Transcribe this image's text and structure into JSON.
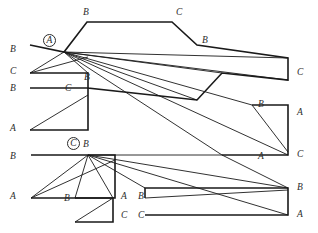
{
  "figure": {
    "canvas": {
      "width": 318,
      "height": 233
    },
    "stroke_color": "#1a1a1a",
    "background_color": "#ffffff",
    "label_color": "#2b2b2b",
    "hub_points": [
      {
        "id": "hub-a",
        "label": "A",
        "x": 64,
        "y": 52,
        "circled": true
      },
      {
        "id": "hub-c",
        "label": "C",
        "x": 88,
        "y": 155,
        "circled": true
      }
    ],
    "vertex_labels": [
      {
        "id": "v-top-b",
        "label": "B",
        "x": 83,
        "y": 8
      },
      {
        "id": "v-top-c",
        "label": "C",
        "x": 176,
        "y": 8
      },
      {
        "id": "v-upper-right-b",
        "label": "B",
        "x": 202,
        "y": 36
      },
      {
        "id": "v-left-b-1",
        "label": "B",
        "x": 10,
        "y": 45
      },
      {
        "id": "v-left-c-1",
        "label": "C",
        "x": 10,
        "y": 67
      },
      {
        "id": "v-right-c-1",
        "label": "C",
        "x": 297,
        "y": 68
      },
      {
        "id": "v-mid-b-1",
        "label": "B",
        "x": 84,
        "y": 73
      },
      {
        "id": "v-left-b-2",
        "label": "B",
        "x": 10,
        "y": 84
      },
      {
        "id": "v-mid-c-1",
        "label": "C",
        "x": 65,
        "y": 84
      },
      {
        "id": "v-right-b-1",
        "label": "B",
        "x": 258,
        "y": 100
      },
      {
        "id": "v-right-a-1",
        "label": "A",
        "x": 297,
        "y": 108
      },
      {
        "id": "v-left-a-1",
        "label": "A",
        "x": 10,
        "y": 124
      },
      {
        "id": "v-hub-c-b",
        "label": "B",
        "x": 83,
        "y": 140
      },
      {
        "id": "v-left-b-3",
        "label": "B",
        "x": 10,
        "y": 152
      },
      {
        "id": "v-mid-a-1",
        "label": "A",
        "x": 258,
        "y": 152
      },
      {
        "id": "v-right-c-2",
        "label": "C",
        "x": 297,
        "y": 150
      },
      {
        "id": "v-left-a-2",
        "label": "A",
        "x": 10,
        "y": 192
      },
      {
        "id": "v-bot-b-1",
        "label": "B",
        "x": 64,
        "y": 194
      },
      {
        "id": "v-bot-a-1",
        "label": "A",
        "x": 121,
        "y": 192
      },
      {
        "id": "v-bot-b-2",
        "label": "B",
        "x": 138,
        "y": 192
      },
      {
        "id": "v-bot-c-1",
        "label": "C",
        "x": 121,
        "y": 211
      },
      {
        "id": "v-bot-c-2",
        "label": "C",
        "x": 138,
        "y": 211
      },
      {
        "id": "v-right-b-2",
        "label": "B",
        "x": 297,
        "y": 183
      },
      {
        "id": "v-right-a-2",
        "label": "A",
        "x": 297,
        "y": 210
      }
    ],
    "outlines": [
      {
        "id": "shape-top",
        "points": "30,45 64,52 87,22 172,22 197,45 288,58 288,80 222,73 197,100 88,88 88,73 30,73"
      },
      {
        "id": "shape-upper-band",
        "points": "30,88 88,88 88,130 30,130"
      },
      {
        "id": "shape-right-upper",
        "points": "252,105 288,105 288,155 222,155"
      },
      {
        "id": "shape-mid-left",
        "points": "31,155 115,155 115,198 31,198"
      },
      {
        "id": "shape-small-box",
        "points": "75,198 113,198 113,222 75,222"
      },
      {
        "id": "shape-bottom-right",
        "points": "145,198 145,188 288,188 288,215 145,215"
      }
    ],
    "cuts": [
      {
        "id": "cut-a-1",
        "from": [
          64,
          52
        ],
        "to": [
          30,
          73
        ]
      },
      {
        "id": "cut-a-2",
        "from": [
          64,
          52
        ],
        "to": [
          88,
          73
        ]
      },
      {
        "id": "cut-a-3",
        "from": [
          64,
          52
        ],
        "to": [
          222,
          73
        ]
      },
      {
        "id": "cut-a-4",
        "from": [
          64,
          52
        ],
        "to": [
          288,
          58
        ]
      },
      {
        "id": "cut-a-5",
        "from": [
          64,
          52
        ],
        "to": [
          288,
          80
        ]
      },
      {
        "id": "cut-a-6",
        "from": [
          64,
          52
        ],
        "to": [
          197,
          100
        ]
      },
      {
        "id": "cut-a-7",
        "from": [
          64,
          52
        ],
        "to": [
          252,
          105
        ]
      },
      {
        "id": "cut-a-8",
        "from": [
          64,
          52
        ],
        "to": [
          222,
          155
        ]
      },
      {
        "id": "cut-a-9",
        "from": [
          64,
          52
        ],
        "to": [
          288,
          155
        ]
      },
      {
        "id": "cut-c-1",
        "from": [
          88,
          155
        ],
        "to": [
          31,
          198
        ]
      },
      {
        "id": "cut-c-2",
        "from": [
          88,
          155
        ],
        "to": [
          75,
          198
        ]
      },
      {
        "id": "cut-c-3",
        "from": [
          88,
          155
        ],
        "to": [
          113,
          198
        ]
      },
      {
        "id": "cut-c-4",
        "from": [
          88,
          155
        ],
        "to": [
          145,
          188
        ]
      },
      {
        "id": "cut-c-5",
        "from": [
          88,
          155
        ],
        "to": [
          288,
          188
        ]
      },
      {
        "id": "cut-c-6",
        "from": [
          88,
          155
        ],
        "to": [
          288,
          215
        ]
      },
      {
        "id": "cut-c-7",
        "from": [
          88,
          155
        ],
        "to": [
          222,
          155
        ]
      },
      {
        "id": "cut-diag-1",
        "from": [
          30,
          73
        ],
        "to": [
          88,
          57
        ]
      },
      {
        "id": "cut-diag-2",
        "from": [
          30,
          130
        ],
        "to": [
          88,
          95
        ]
      },
      {
        "id": "cut-diag-3",
        "from": [
          31,
          198
        ],
        "to": [
          115,
          160
        ]
      },
      {
        "id": "cut-diag-4",
        "from": [
          75,
          222
        ],
        "to": [
          113,
          198
        ]
      },
      {
        "id": "cut-diag-5",
        "from": [
          252,
          105
        ],
        "to": [
          288,
          152
        ]
      },
      {
        "id": "cut-diag-6",
        "from": [
          145,
          198
        ],
        "to": [
          288,
          190
        ]
      },
      {
        "id": "cut-diag-7",
        "from": [
          222,
          155
        ],
        "to": [
          288,
          188
        ]
      }
    ]
  }
}
